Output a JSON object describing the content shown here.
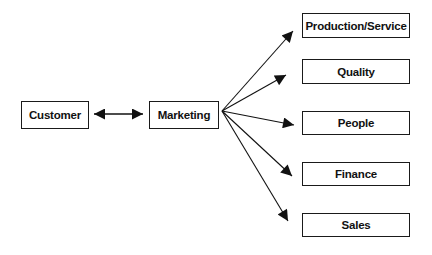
{
  "diagram": {
    "type": "flow",
    "nodes": {
      "customer": "Customer",
      "marketing": "Marketing",
      "production": "Production/Service",
      "quality": "Quality",
      "people": "People",
      "finance": "Finance",
      "sales": "Sales"
    },
    "edges": [
      {
        "from": "Customer",
        "to": "Marketing",
        "direction": "bidirectional"
      },
      {
        "from": "Marketing",
        "to": "Production/Service",
        "direction": "forward"
      },
      {
        "from": "Marketing",
        "to": "Quality",
        "direction": "forward"
      },
      {
        "from": "Marketing",
        "to": "People",
        "direction": "forward"
      },
      {
        "from": "Marketing",
        "to": "Finance",
        "direction": "forward"
      },
      {
        "from": "Marketing",
        "to": "Sales",
        "direction": "forward"
      }
    ],
    "colors": {
      "stroke": "#1a1a1a",
      "background": "#ffffff"
    }
  }
}
